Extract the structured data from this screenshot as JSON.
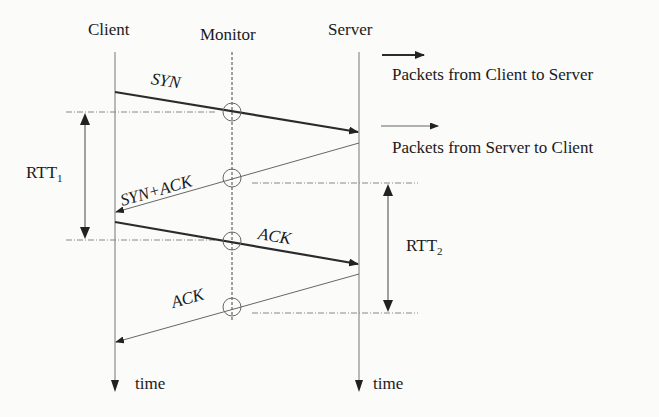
{
  "diagram": {
    "type": "sequence-timing",
    "actors": [
      {
        "id": "client",
        "label": "Client",
        "x": 115
      },
      {
        "id": "monitor",
        "label": "Monitor",
        "x": 232
      },
      {
        "id": "server",
        "label": "Server",
        "x": 359
      }
    ],
    "messages": [
      {
        "label": "SYN",
        "from": "client",
        "to": "server",
        "style": "thick"
      },
      {
        "label": "SYN+ACK",
        "from": "server",
        "to": "client",
        "style": "thin"
      },
      {
        "label": "ACK",
        "from": "client",
        "to": "server",
        "style": "thick"
      },
      {
        "label": "ACK",
        "from": "server",
        "to": "client",
        "style": "thin"
      }
    ],
    "intervals": [
      {
        "label_main": "RTT",
        "label_sub": "1",
        "between": "SYN and ACK observed at Monitor"
      },
      {
        "label_main": "RTT",
        "label_sub": "2",
        "between": "SYN+ACK and final ACK observed at Monitor"
      }
    ],
    "time_axis_label": "time",
    "legend": [
      {
        "style": "thick",
        "label": "Packets from Client to Server"
      },
      {
        "style": "thin",
        "label": "Packets from Server to Client"
      }
    ],
    "colors": {
      "line": "#2b2b2b",
      "thin_line": "#6a6a6a",
      "background": "#fbfbfa"
    }
  }
}
